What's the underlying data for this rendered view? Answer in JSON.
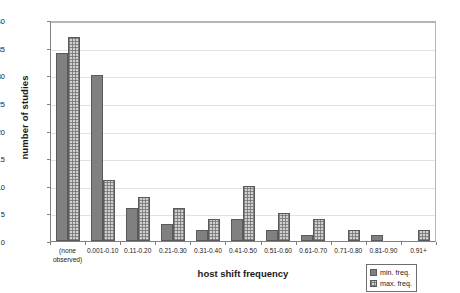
{
  "chart_data": {
    "type": "bar",
    "title": "",
    "xlabel": "host shift frequency",
    "ylabel": "number of studies",
    "ylim": [
      0,
      40
    ],
    "yticks": [
      0,
      5,
      10,
      15,
      20,
      25,
      30,
      35,
      40
    ],
    "grid": true,
    "legend_position": "bottom-right",
    "categories": [
      "(none\nobserved)",
      "0.001-0.10",
      "0.11-0.20",
      "0.21-0.30",
      "0.31-0.40",
      "0.41-0.50",
      "0.51-0.60",
      "0.61-0.70",
      "0.71-0.80",
      "0.81-0.90",
      "0.91+"
    ],
    "series": [
      {
        "name": "min. freq.",
        "color": "#808080",
        "pattern": "solid",
        "values": [
          34,
          30,
          6,
          3,
          2,
          4,
          2,
          1,
          0,
          1,
          0
        ]
      },
      {
        "name": "max. freq.",
        "color": "#d0d0d0",
        "pattern": "crosshatch",
        "values": [
          37,
          11,
          8,
          6,
          4,
          10,
          5,
          4,
          2,
          0,
          2
        ]
      }
    ]
  },
  "legend": {
    "items": [
      {
        "label": "min. freq."
      },
      {
        "label": "max. freq."
      }
    ]
  }
}
